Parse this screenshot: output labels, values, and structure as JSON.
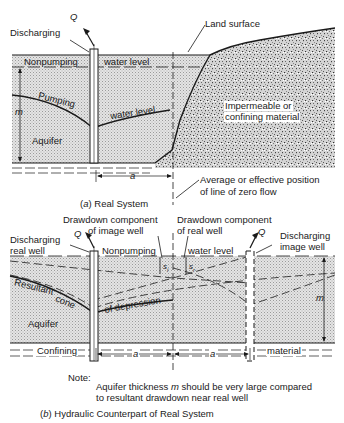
{
  "part_a": {
    "caption_letter": "a",
    "caption_text": "Real  System",
    "labels": {
      "discharge": "Q",
      "discharging": "Discharging",
      "land_surface": "Land surface",
      "nonpumping": "Nonpumping",
      "water_level_static": "water level",
      "pumping": "Pumping",
      "water_level_pumping": "water level",
      "thickness": "m",
      "aquifer": "Aquifer",
      "impermeable_line1": "Impermeable or",
      "impermeable_line2": "confining material",
      "distance": "a",
      "zero_flow_line1": "Average or effective position",
      "zero_flow_line2": "of line of zero flow"
    }
  },
  "part_b": {
    "caption_letter": "b",
    "caption_text": "Hydraulic Counterpart of Real System",
    "labels": {
      "drawdown_image_line1": "Drawdown component",
      "drawdown_image_line2": "of image well",
      "drawdown_real_line1": "Drawdown component",
      "drawdown_real_line2": "of real well",
      "discharge_real": "Q",
      "discharge_image": "Q",
      "discharging_real_line1": "Discharging",
      "discharging_real_line2": "real well",
      "discharging_image_line1": "Discharging",
      "discharging_image_line2": "image well",
      "nonpumping": "Nonpumping",
      "water_level": "water level",
      "s_image": "s",
      "s_image_sub": "i",
      "s_real": "s",
      "s_real_sub": "r",
      "cone_part1": "Resultant",
      "cone_part2": "cone",
      "cone_part3": "of depression",
      "aquifer": "Aquifer",
      "thickness": "m",
      "confining": "Confining",
      "material": "material",
      "distance_left": "a",
      "distance_right": "a"
    },
    "note_title": "Note:",
    "note_line1_pre": "Aquifer thickness ",
    "note_line1_var": "m",
    "note_line1_post": " should be very large compared",
    "note_line2": "to resultant drawdown near real well"
  },
  "colors": {
    "ink": "#1a1a1a",
    "aquifer_fill": "#d6d6d6",
    "rock_fill": "#c8c8c8",
    "background": "#ffffff"
  }
}
